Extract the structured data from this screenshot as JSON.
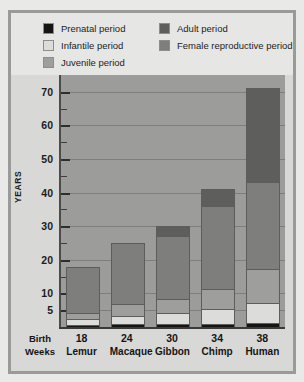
{
  "colors": {
    "prenatal": "#151515",
    "infantile": "#dcdcda",
    "juvenile": "#9e9e9c",
    "adult": "#5e5e5c",
    "female_reproductive": "#7e7e7c",
    "plot_background": "#9c9c9a",
    "figure_background": "#d8d8d6",
    "legend_background": "#e6e6e4",
    "page_background": "#e9e9e7",
    "frame": "#9a9a98"
  },
  "legend": {
    "left_column": [
      {
        "label": "Prenatal period",
        "swatch": "prenatal"
      },
      {
        "label": "Infantile period",
        "swatch": "infantile"
      },
      {
        "label": "Juvenile period",
        "swatch": "juvenile"
      }
    ],
    "right_column": [
      {
        "label": "Adult period",
        "swatch": "adult"
      },
      {
        "label": "Female reproductive period",
        "swatch": "female_reproductive"
      }
    ]
  },
  "axes": {
    "ylabel": "YEARS",
    "birth_weeks_label_line1": "Birth",
    "birth_weeks_label_line2": "Weeks",
    "yticks_major": [
      5,
      10,
      20,
      30,
      40,
      50,
      60,
      70
    ],
    "yticks_minor": [
      15,
      25,
      35,
      45,
      55,
      65
    ],
    "ylim": [
      0,
      75
    ]
  },
  "chart_data": {
    "type": "bar",
    "title": "",
    "subtitle": "",
    "xlabel": "",
    "ylabel": "YEARS",
    "ylim": [
      0,
      75
    ],
    "grid": true,
    "stacked": true,
    "legend_position": "top",
    "categories": [
      "Lemur",
      "Macaque",
      "Gibbon",
      "Chimp",
      "Human"
    ],
    "birth_weeks": [
      18,
      24,
      30,
      34,
      38
    ],
    "series": [
      {
        "name": "Prenatal period",
        "values": [
          0.4,
          0.5,
          0.6,
          0.7,
          0.8
        ]
      },
      {
        "name": "Infantile period",
        "values": [
          1.6,
          2.5,
          3.4,
          4.3,
          6.2
        ]
      },
      {
        "name": "Juvenile period",
        "values": [
          2.0,
          3.5,
          4.0,
          6.0,
          10.0
        ]
      },
      {
        "name": "Female reproductive period",
        "values": [
          14.0,
          18.5,
          19.0,
          25.0,
          26.0
        ]
      },
      {
        "name": "Adult period",
        "values": [
          0.0,
          0.0,
          3.0,
          5.0,
          28.0
        ]
      }
    ],
    "totals": [
      18,
      25,
      30,
      41,
      71
    ]
  }
}
